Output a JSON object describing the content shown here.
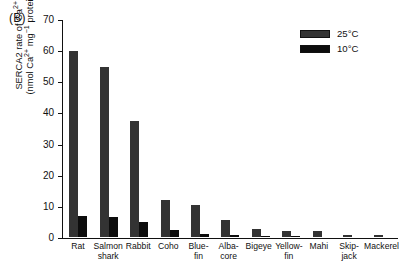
{
  "panel": {
    "label": "(B)"
  },
  "legend": {
    "position": "top-right",
    "entries": [
      {
        "label": "25°C",
        "color": "#333333",
        "name": "warm"
      },
      {
        "label": "10°C",
        "color": "#0d0d0d",
        "name": "cold"
      }
    ]
  },
  "axes": {
    "y_label_line1": "SERCA2 rate of Ca",
    "y_label_line1_sup": "2+",
    "y_label_line1_tail": " uptake",
    "y_label_line2_a": "(nmol Ca",
    "y_label_line2_a_sup": "2+",
    "y_label_line2_b": " mg",
    "y_label_line2_b_sup": "−1",
    "y_label_line2_c": " protein min",
    "y_label_line2_c_sup": "−1",
    "y_label_line2_d": ")",
    "y_ticks": [
      "0",
      "10",
      "20",
      "30",
      "40",
      "50",
      "60",
      "70"
    ],
    "x_labels": [
      {
        "line1": "Rat",
        "line2": ""
      },
      {
        "line1": "Salmon",
        "line2": "shark"
      },
      {
        "line1": "Rabbit",
        "line2": ""
      },
      {
        "line1": "Coho",
        "line2": ""
      },
      {
        "line1": "Blue-",
        "line2": "fin"
      },
      {
        "line1": "Alba-",
        "line2": "core"
      },
      {
        "line1": "Bigeye",
        "line2": ""
      },
      {
        "line1": "Yellow-",
        "line2": "fin"
      },
      {
        "line1": "Mahi",
        "line2": ""
      },
      {
        "line1": "Skip-",
        "line2": "jack"
      },
      {
        "line1": "Mackerel",
        "line2": ""
      }
    ]
  },
  "chart_data": {
    "type": "bar",
    "title": "",
    "subtitle": "",
    "panel_label": "(B)",
    "categories": [
      "Rat",
      "Salmon shark",
      "Rabbit",
      "Coho",
      "Bluefin",
      "Albacore",
      "Bigeye",
      "Yellowfin",
      "Mahi",
      "Skipjack",
      "Mackerel"
    ],
    "series": [
      {
        "name": "25°C",
        "color": "#333333",
        "values": [
          60.0,
          55.0,
          37.5,
          12.0,
          10.3,
          5.5,
          2.6,
          1.8,
          2.0,
          0.6,
          0.7
        ]
      },
      {
        "name": "10°C",
        "color": "#0d0d0d",
        "values": [
          6.8,
          6.6,
          5.0,
          2.3,
          0.9,
          0.6,
          0.3,
          0.2,
          0.0,
          0.0,
          0.0
        ]
      }
    ],
    "xlabel": "",
    "ylabel": "SERCA2 rate of Ca2+ uptake (nmol Ca2+ mg-1 protein min-1)",
    "ylim": [
      0,
      70
    ],
    "ytick_step": 10,
    "grid": false,
    "legend_position": "top-right"
  }
}
